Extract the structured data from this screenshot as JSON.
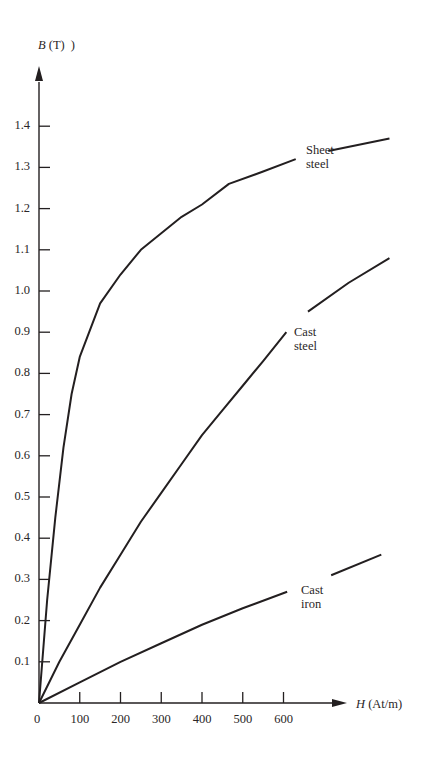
{
  "chart_data": {
    "type": "line",
    "title": "",
    "xlabel": "H (At/m)",
    "ylabel": "B (T)",
    "x_label_var": "H",
    "x_label_unit": "(At/m)",
    "y_label_var": "B",
    "y_label_unit": "(T)",
    "y_label_stray": ")",
    "x_ticks": [
      "0",
      "100",
      "200",
      "300",
      "400",
      "500",
      "600"
    ],
    "y_ticks": [
      "0.1",
      "0.2",
      "0.3",
      "0.4",
      "0.5",
      "0.6",
      "0.7",
      "0.8",
      "0.9",
      "1.0",
      "1.1",
      "1.2",
      "1.3",
      "1.4"
    ],
    "xlim": [
      0,
      860
    ],
    "ylim": [
      0,
      1.4
    ],
    "grid": false,
    "legend": "inline labels",
    "series": [
      {
        "name": "Sheet steel",
        "label_lines": [
          "Sheet",
          "steel"
        ],
        "x": [
          0,
          20,
          40,
          60,
          80,
          100,
          150,
          200,
          250,
          300,
          350,
          400,
          466,
          550,
          630,
          710,
          860
        ],
        "y": [
          0,
          0.25,
          0.45,
          0.62,
          0.75,
          0.84,
          0.97,
          1.04,
          1.1,
          1.14,
          1.18,
          1.21,
          1.26,
          1.29,
          1.32,
          1.34,
          1.37
        ]
      },
      {
        "name": "Cast steel",
        "label_lines": [
          "Cast",
          "steel"
        ],
        "x": [
          0,
          50,
          100,
          150,
          200,
          250,
          300,
          350,
          400,
          450,
          500,
          550,
          607,
          660,
          760,
          860
        ],
        "y": [
          0,
          0.1,
          0.19,
          0.28,
          0.36,
          0.44,
          0.51,
          0.58,
          0.65,
          0.71,
          0.77,
          0.83,
          0.9,
          0.95,
          1.02,
          1.08
        ]
      },
      {
        "name": "Cast iron",
        "label_lines": [
          "Cast",
          "iron"
        ],
        "x": [
          0,
          100,
          200,
          300,
          400,
          500,
          609,
          717,
          840
        ],
        "y": [
          0,
          0.05,
          0.1,
          0.145,
          0.19,
          0.23,
          0.27,
          0.31,
          0.36
        ]
      }
    ]
  }
}
